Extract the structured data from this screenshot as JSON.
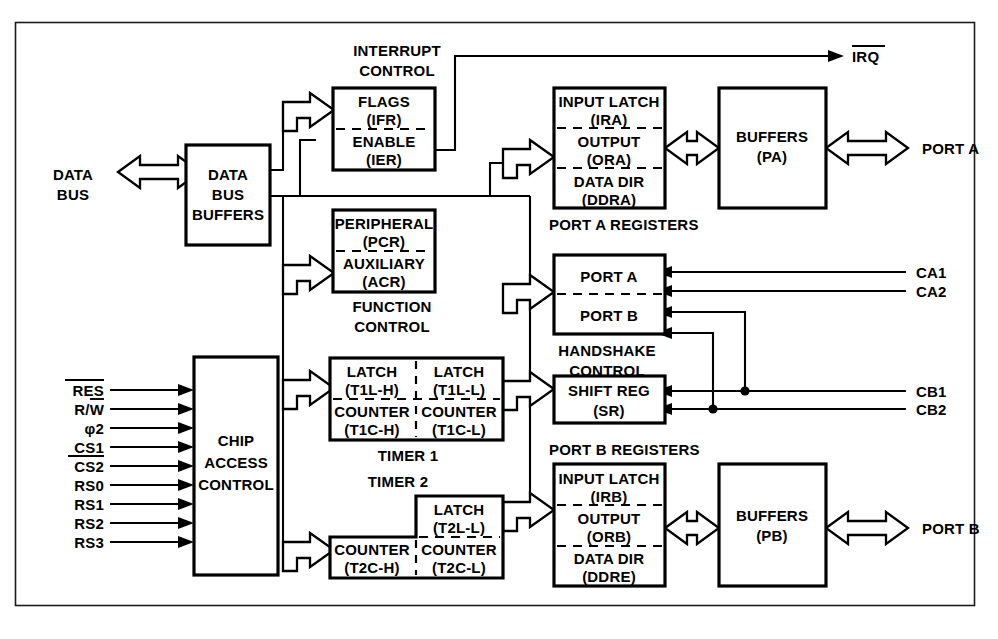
{
  "diagram": {
    "background": "#ffffff",
    "ink": "#000000",
    "frame_stroke": "#1b1b1b"
  },
  "left_io": {
    "data_bus_label_line1": "DATA",
    "data_bus_label_line2": "BUS",
    "signals": [
      {
        "name": "RES",
        "overbar": "full"
      },
      {
        "name": "R/W",
        "overbar": "partial"
      },
      {
        "name": "φ2",
        "overbar": "none"
      },
      {
        "name": "CS1",
        "overbar": "none"
      },
      {
        "name": "CS2",
        "overbar": "full"
      },
      {
        "name": "RS0",
        "overbar": "none"
      },
      {
        "name": "RS1",
        "overbar": "none"
      },
      {
        "name": "RS2",
        "overbar": "none"
      },
      {
        "name": "RS3",
        "overbar": "none"
      }
    ]
  },
  "right_io": {
    "irq": "IRQ",
    "port_a": "PORT A",
    "port_b": "PORT B",
    "ca1": "CA1",
    "ca2": "CA2",
    "cb1": "CB1",
    "cb2": "CB2"
  },
  "blocks": {
    "data_bus_buffers": {
      "lines": [
        "DATA",
        "BUS",
        "BUFFERS"
      ]
    },
    "chip_access_control": {
      "lines": [
        "CHIP",
        "ACCESS",
        "CONTROL"
      ]
    },
    "interrupt_control": {
      "caption_line1": "INTERRUPT",
      "caption_line2": "CONTROL",
      "top_name": "FLAGS",
      "top_abbr": "(IFR)",
      "bottom_name": "ENABLE",
      "bottom_abbr": "(IER)"
    },
    "function_control": {
      "caption_line1": "FUNCTION",
      "caption_line2": "CONTROL",
      "top_name": "PERIPHERAL",
      "top_abbr": "(PCR)",
      "bottom_name": "AUXILIARY",
      "bottom_abbr": "(ACR)"
    },
    "timer1": {
      "caption": "TIMER 1",
      "cells": [
        {
          "name": "LATCH",
          "abbr": "(T1L-H)"
        },
        {
          "name": "LATCH",
          "abbr": "(T1L-L)"
        },
        {
          "name": "COUNTER",
          "abbr": "(T1C-H)"
        },
        {
          "name": "COUNTER",
          "abbr": "(T1C-L)"
        }
      ]
    },
    "timer2": {
      "caption": "TIMER 2",
      "cells": [
        {
          "name": "LATCH",
          "abbr": "(T2L-L)"
        },
        {
          "name": "COUNTER",
          "abbr": "(T2C-H)"
        },
        {
          "name": "COUNTER",
          "abbr": "(T2C-L)"
        }
      ]
    },
    "port_a_registers": {
      "caption": "PORT A REGISTERS",
      "rows": [
        {
          "name": "INPUT LATCH",
          "abbr": "(IRA)"
        },
        {
          "name": "OUTPUT",
          "abbr": "(ORA)"
        },
        {
          "name": "DATA DIR",
          "abbr": "(DDRA)"
        }
      ]
    },
    "port_b_registers": {
      "caption": "PORT B REGISTERS",
      "rows": [
        {
          "name": "INPUT LATCH",
          "abbr": "(IRB)"
        },
        {
          "name": "OUTPUT",
          "abbr": "(ORB)"
        },
        {
          "name": "DATA DIR",
          "abbr": "(DDRE)"
        }
      ]
    },
    "handshake_control": {
      "caption_line1": "HANDSHAKE",
      "caption_line2": "CONTROL",
      "top_name": "PORT A",
      "bottom_name": "PORT B"
    },
    "shift_register": {
      "name": "SHIFT REG",
      "abbr": "(SR)"
    },
    "buffers_pa": {
      "name": "BUFFERS",
      "abbr": "(PA)"
    },
    "buffers_pb": {
      "name": "BUFFERS",
      "abbr": "(PB)"
    }
  }
}
